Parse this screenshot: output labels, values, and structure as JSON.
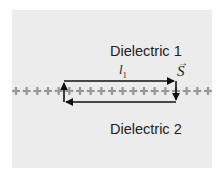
{
  "diagram": {
    "regions": [
      {
        "name": "Dielectric 1",
        "label": "Dielectric 1",
        "position": "above interface"
      },
      {
        "name": "Dielectric 2",
        "label": "Dielectric 2",
        "position": "below interface"
      }
    ],
    "interface": {
      "symbol": "+",
      "count": 19,
      "color": "#999999"
    },
    "loop": {
      "length_label": "l",
      "length_subscript": "1",
      "direction": "clockwise (top: right, right: down, bottom: left, left: up)",
      "color": "#111111"
    },
    "surface_vector_label": "S",
    "surface_vector_arrow": "→",
    "colors": {
      "background": "#ffffff",
      "panel": "#ececec",
      "text": "#222222"
    }
  }
}
